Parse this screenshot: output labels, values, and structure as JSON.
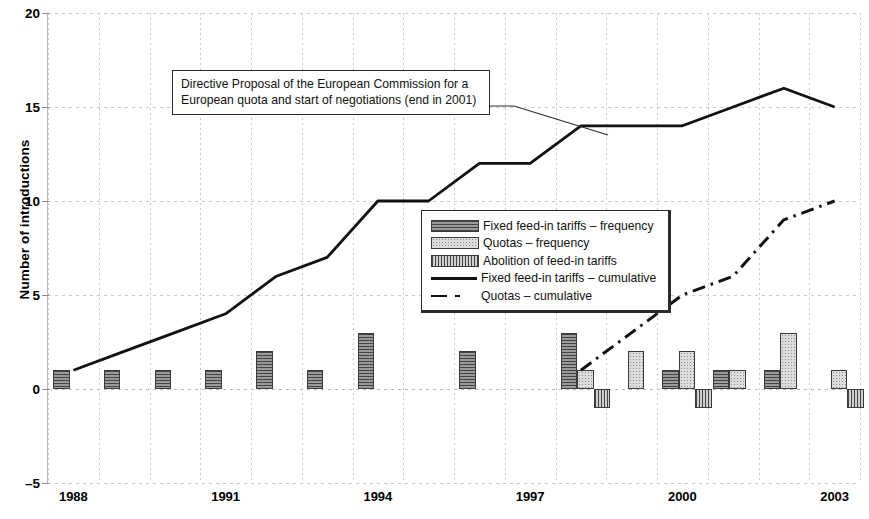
{
  "chart_data": {
    "type": "bar",
    "title": "",
    "xlabel": "",
    "ylabel": "Number of introductions",
    "ylim": [
      -5,
      20
    ],
    "yticks": [
      -5,
      0,
      5,
      10,
      15,
      20
    ],
    "xlim": [
      1988,
      2003
    ],
    "xticks": [
      1988,
      1991,
      1994,
      1997,
      2000,
      2003
    ],
    "xticklabels": [
      "1988",
      "1991",
      "1994",
      "1997",
      "2000",
      "2003"
    ],
    "grid": true,
    "legend_position": "center",
    "categories": [
      1988,
      1989,
      1990,
      1991,
      1992,
      1993,
      1994,
      1995,
      1996,
      1997,
      1998,
      1999,
      2000,
      2001,
      2002,
      2003
    ],
    "series": [
      {
        "name": "Fixed feed-in tariffs – frequency",
        "type": "bar",
        "values": [
          1,
          1,
          1,
          1,
          2,
          1,
          3,
          0,
          2,
          0,
          3,
          0,
          1,
          1,
          1,
          0
        ]
      },
      {
        "name": "Quotas – frequency",
        "type": "bar",
        "values": [
          0,
          0,
          0,
          0,
          0,
          0,
          0,
          0,
          0,
          0,
          1,
          2,
          2,
          1,
          3,
          1
        ]
      },
      {
        "name": "Abolition of feed-in tariffs",
        "type": "bar",
        "values": [
          0,
          0,
          0,
          0,
          0,
          0,
          0,
          0,
          0,
          0,
          -1,
          0,
          -1,
          0,
          0,
          -1
        ]
      },
      {
        "name": "Fixed feed-in tariffs – cumulative",
        "type": "line",
        "style": "solid",
        "values": [
          1,
          2,
          3,
          4,
          6,
          7,
          10,
          10,
          12,
          12,
          14,
          14,
          14,
          15,
          16,
          15
        ]
      },
      {
        "name": "Quotas – cumulative",
        "type": "line",
        "style": "dashdot",
        "start_year": 1998,
        "values": [
          null,
          null,
          null,
          null,
          null,
          null,
          null,
          null,
          null,
          null,
          1,
          3,
          5,
          6,
          9,
          10
        ]
      }
    ],
    "annotations": [
      {
        "name": "directive-proposal",
        "line1": "Directive Proposal of the European Commission for a",
        "line2": "European quota and start of negotiations (end in 2001)",
        "points_to_year": 1998,
        "points_to_value": 14
      }
    ]
  },
  "axes": {
    "y_title": "Number of introductions",
    "y_ticks": [
      "20",
      "15",
      "10",
      "5",
      "0",
      "–5"
    ],
    "x_ticks": [
      "1988",
      "1991",
      "1994",
      "1997",
      "2000",
      "2003"
    ]
  },
  "legend": {
    "items": [
      {
        "key": "fixed",
        "label": "Fixed feed-in tariffs – frequency"
      },
      {
        "key": "quota",
        "label": "Quotas – frequency"
      },
      {
        "key": "abol",
        "label": "Abolition of feed-in tariffs"
      },
      {
        "key": "solid",
        "label": "Fixed feed-in tariffs – cumulative"
      },
      {
        "key": "dashdot",
        "label": "Quotas – cumulative"
      }
    ]
  },
  "annotation": {
    "line1": "Directive Proposal of the European Commission for a",
    "line2": "European quota and start of negotiations (end in 2001)"
  },
  "colors": {
    "ink": "#111111",
    "grid": "#c9c9c9",
    "bar_fixed": "#9a9a9a",
    "bar_quota": "#dcdcdc",
    "bar_abolition": "#cfcfcf",
    "bar_border": "#3a3a3a"
  }
}
